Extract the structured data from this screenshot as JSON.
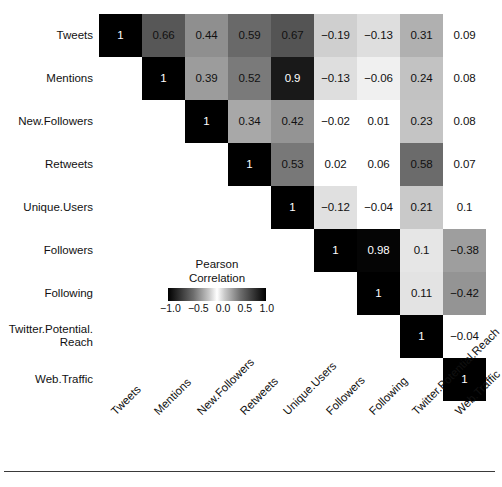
{
  "figure": {
    "kind": "correlation-matrix-heatmap",
    "background": "#ffffff",
    "rule_color": "#3a3a3a"
  },
  "legend": {
    "title_line1": "Pearson",
    "title_line2": "Correlation",
    "ticks": [
      "−1.0",
      "−0.5",
      "0.0",
      "0.5",
      "1.0"
    ],
    "min": -1.0,
    "max": 1.0,
    "colormap": "diverging-grayscale (black at −1, white at 0, black at +1)"
  },
  "chart_data": {
    "type": "heatmap",
    "title": "",
    "subtitle": "",
    "xlabel": "",
    "ylabel": "",
    "grid": false,
    "legend_position": "inside-lower-left",
    "colorbar_label": "Pearson Correlation",
    "zlim": [
      -1.0,
      1.0
    ],
    "triangle": "upper",
    "cell_text_format": "trimmed decimal",
    "x": [
      "Tweets",
      "Mentions",
      "New.Followers",
      "Retweets",
      "Unique.Users",
      "Followers",
      "Following",
      "Twitter.Potential.Reach",
      "Web.Traffic"
    ],
    "y": [
      "Tweets",
      "Mentions",
      "New.Followers",
      "Retweets",
      "Unique.Users",
      "Followers",
      "Following",
      "Twitter.Potential.Reach",
      "Web.Traffic"
    ],
    "y_display": [
      "Tweets",
      "Mentions",
      "New.Followers",
      "Retweets",
      "Unique.Users",
      "Followers",
      "Following",
      "Twitter.Potential.\nReach",
      "Web.Traffic"
    ],
    "values": [
      [
        1,
        0.66,
        0.44,
        0.59,
        0.67,
        -0.19,
        -0.13,
        0.31,
        0.09
      ],
      [
        null,
        1,
        0.39,
        0.52,
        0.9,
        -0.13,
        -0.06,
        0.24,
        0.08
      ],
      [
        null,
        null,
        1,
        0.34,
        0.42,
        -0.02,
        0.01,
        0.23,
        0.08
      ],
      [
        null,
        null,
        null,
        1,
        0.53,
        0.02,
        0.06,
        0.58,
        0.07
      ],
      [
        null,
        null,
        null,
        null,
        1,
        -0.12,
        -0.04,
        0.21,
        0.1
      ],
      [
        null,
        null,
        null,
        null,
        null,
        1,
        0.98,
        0.1,
        -0.38
      ],
      [
        null,
        null,
        null,
        null,
        null,
        null,
        1,
        0.11,
        -0.42
      ],
      [
        null,
        null,
        null,
        null,
        null,
        null,
        null,
        1,
        -0.04
      ],
      [
        null,
        null,
        null,
        null,
        null,
        null,
        null,
        null,
        1
      ]
    ],
    "labels": [
      [
        "1",
        "0.66",
        "0.44",
        "0.59",
        "0.67",
        "−0.19",
        "−0.13",
        "0.31",
        "0.09"
      ],
      [
        null,
        "1",
        "0.39",
        "0.52",
        "0.9",
        "−0.13",
        "−0.06",
        "0.24",
        "0.08"
      ],
      [
        null,
        null,
        "1",
        "0.34",
        "0.42",
        "−0.02",
        "0.01",
        "0.23",
        "0.08"
      ],
      [
        null,
        null,
        null,
        "1",
        "0.53",
        "0.02",
        "0.06",
        "0.58",
        "0.07"
      ],
      [
        null,
        null,
        null,
        null,
        "1",
        "−0.12",
        "−0.04",
        "0.21",
        "0.1"
      ],
      [
        null,
        null,
        null,
        null,
        null,
        "1",
        "0.98",
        "0.1",
        "−0.38"
      ],
      [
        null,
        null,
        null,
        null,
        null,
        null,
        "1",
        "0.11",
        "−0.42"
      ],
      [
        null,
        null,
        null,
        null,
        null,
        null,
        null,
        "1",
        "−0.04"
      ],
      [
        null,
        null,
        null,
        null,
        null,
        null,
        null,
        null,
        "1"
      ]
    ],
    "unfilled_cells": [
      {
        "row": 0,
        "col": 8
      },
      {
        "row": 1,
        "col": 8
      },
      {
        "row": 2,
        "col": 5
      },
      {
        "row": 2,
        "col": 6
      },
      {
        "row": 2,
        "col": 8
      },
      {
        "row": 3,
        "col": 5
      },
      {
        "row": 3,
        "col": 6
      },
      {
        "row": 3,
        "col": 8
      },
      {
        "row": 4,
        "col": 6
      },
      {
        "row": 4,
        "col": 8
      },
      {
        "row": 7,
        "col": 8
      }
    ]
  },
  "geometry": {
    "cell_size": 43,
    "origin_x": 99,
    "origin_y": 14
  }
}
